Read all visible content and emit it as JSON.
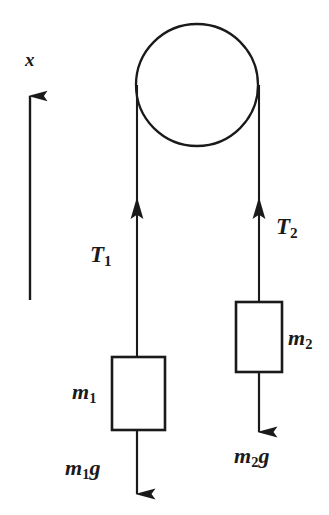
{
  "figure": {
    "kind": "atwood-machine-free-body-diagram",
    "background_color": "#ffffff",
    "ink_color": "#1a1a1a",
    "width": 329,
    "height": 515
  },
  "axis": {
    "name": "x-axis-arrow",
    "label": "x",
    "direction": "up",
    "line_x": 30,
    "tip_y": 92,
    "base_y": 300
  },
  "pulley": {
    "name": "pulley",
    "center_x": 197,
    "center_y": 85,
    "radius": 61,
    "stroke_width": 2.2
  },
  "ropes": [
    {
      "name": "left-rope",
      "x": 137,
      "top_y": 85,
      "bottom_y": 357
    },
    {
      "name": "right-rope",
      "x": 259,
      "top_y": 85,
      "bottom_y": 302
    }
  ],
  "tensions": [
    {
      "name": "tension-1",
      "label": "T",
      "subscript": "1",
      "arrow_x": 137,
      "arrow_tip_y": 198,
      "arrow_tail_y": 357,
      "direction": "up"
    },
    {
      "name": "tension-2",
      "label": "T",
      "subscript": "2",
      "arrow_x": 259,
      "arrow_tip_y": 198,
      "arrow_tail_y": 302,
      "direction": "up"
    }
  ],
  "blocks": [
    {
      "name": "block-m1",
      "label": "m",
      "subscript": "1",
      "x": 112,
      "y": 357,
      "width": 53,
      "height": 73
    },
    {
      "name": "block-m2",
      "label": "m",
      "subscript": "2",
      "x": 236,
      "y": 302,
      "width": 46,
      "height": 70
    }
  ],
  "weights": [
    {
      "name": "weight-m1g",
      "label": "m",
      "subscript": "1",
      "suffix": "g",
      "arrow_x": 137,
      "arrow_tail_y": 430,
      "arrow_tip_y": 500,
      "direction": "down"
    },
    {
      "name": "weight-m2g",
      "label": "m",
      "subscript": "2",
      "suffix": "g",
      "arrow_x": 259,
      "arrow_tail_y": 372,
      "arrow_tip_y": 438,
      "direction": "down"
    }
  ]
}
